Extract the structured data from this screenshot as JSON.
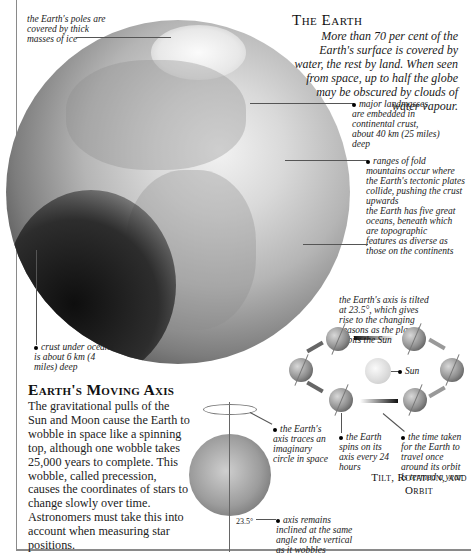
{
  "header": {
    "title": "The Earth",
    "intro": "More than 70 per cent of the Earth's surface is covered by water, the rest by land. When seen from space, up to half the globe may be obscured by clouds of water vapour."
  },
  "globe_labels": {
    "poles": "the Earth's poles are covered by thick masses of ice",
    "landmasses": "major landmasses are embedded in continental crust, about 40 km (25 miles) deep",
    "mountains": "ranges of fold mountains occur where the Earth's tectonic plates collide, pushing the crust upwards",
    "oceans": "the Earth has five great oceans, beneath which are topographic features as diverse as those on the continents",
    "ocean_crust": "crust under oceans is about 6 km (4 miles) deep"
  },
  "moving_axis": {
    "title": "Earth's Moving Axis",
    "body": "The gravitational pulls of the Sun and Moon cause the Earth to wobble in space like a spinning top, although one wobble takes 25,000 years to complete. This wobble, called precession, causes the coordinates of stars to change slowly over time. Astronomers must take this into account when measuring star positions.",
    "label_circle": "the Earth's axis traces an imaginary circle in space",
    "label_inclined": "axis remains inclined at the same angle to the vertical as it wobbles",
    "angle": "23.5°"
  },
  "orbit": {
    "title": "Tilt, Rotation, and Orbit",
    "label_tilt": "the Earth's axis is tilted at 23.5°, which gives rise to the changing seasons as the planet orbits the Sun",
    "label_sun": "Sun",
    "label_spin": "the Earth spins on its axis every 24 hours",
    "label_year": "the time taken for the Earth to travel once around its orbit is termed a year"
  }
}
